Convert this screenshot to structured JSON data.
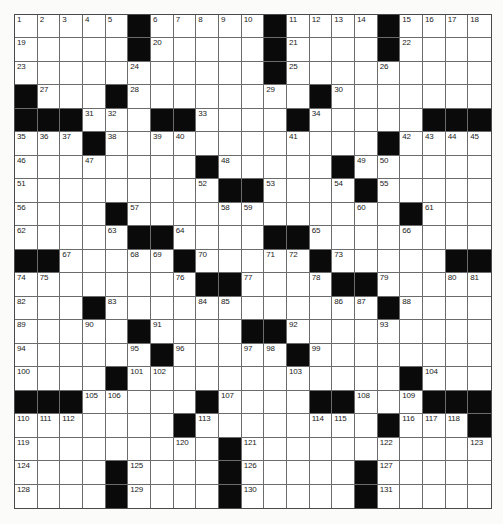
{
  "puzzle": {
    "rows": 21,
    "cols": 21,
    "colors": {
      "black_square": "#0a0a0a",
      "white_square": "#ffffff",
      "grid_line": "#6b6b6b",
      "background": "#fbfbfa"
    },
    "legend": "'#' = black square, number = clue label cell, '.' = empty white cell",
    "grid": [
      [
        "1",
        "2",
        "3",
        "4",
        "5",
        "#",
        "6",
        "7",
        "8",
        "9",
        "10",
        "#",
        "11",
        "12",
        "13",
        "14",
        "#",
        "15",
        "16",
        "17",
        "18"
      ],
      [
        "19",
        ".",
        ".",
        ".",
        ".",
        "#",
        "20",
        ".",
        ".",
        ".",
        ".",
        "#",
        "21",
        ".",
        ".",
        ".",
        "#",
        "22",
        ".",
        ".",
        "."
      ],
      [
        "23",
        ".",
        ".",
        ".",
        ".",
        "24",
        ".",
        ".",
        ".",
        ".",
        ".",
        "#",
        "25",
        ".",
        ".",
        ".",
        "26",
        ".",
        ".",
        ".",
        "."
      ],
      [
        "#",
        "27",
        ".",
        ".",
        "#",
        "28",
        ".",
        ".",
        ".",
        ".",
        ".",
        "29",
        ".",
        "#",
        "30",
        ".",
        ".",
        ".",
        ".",
        ".",
        "."
      ],
      [
        "#",
        "#",
        "#",
        "31",
        "32",
        ".",
        "#",
        "#",
        "33",
        ".",
        ".",
        ".",
        "#",
        "34",
        ".",
        ".",
        ".",
        ".",
        "#",
        "#",
        "#"
      ],
      [
        "35",
        "36",
        "37",
        "#",
        "38",
        ".",
        "39",
        "40",
        ".",
        ".",
        ".",
        ".",
        "41",
        ".",
        ".",
        ".",
        "#",
        "42",
        "43",
        "44",
        "45"
      ],
      [
        "46",
        ".",
        ".",
        "47",
        ".",
        ".",
        ".",
        ".",
        "#",
        "48",
        ".",
        ".",
        ".",
        ".",
        "#",
        "49",
        "50",
        ".",
        ".",
        ".",
        "."
      ],
      [
        "51",
        ".",
        ".",
        ".",
        ".",
        ".",
        ".",
        ".",
        "52",
        "#",
        "#",
        "53",
        ".",
        ".",
        "54",
        "#",
        "55",
        ".",
        ".",
        ".",
        "."
      ],
      [
        "56",
        ".",
        ".",
        ".",
        "#",
        "57",
        ".",
        ".",
        ".",
        "58",
        "59",
        ".",
        ".",
        ".",
        ".",
        "60",
        ".",
        "#",
        "61",
        ".",
        "."
      ],
      [
        "62",
        ".",
        ".",
        ".",
        "63",
        "#",
        "#",
        "64",
        ".",
        ".",
        ".",
        "#",
        "#",
        "65",
        ".",
        ".",
        ".",
        "66",
        ".",
        ".",
        "."
      ],
      [
        "#",
        "#",
        "67",
        ".",
        ".",
        "68",
        "69",
        "#",
        "70",
        ".",
        ".",
        "71",
        "72",
        "#",
        "73",
        ".",
        ".",
        ".",
        ".",
        "#",
        "#"
      ],
      [
        "74",
        "75",
        ".",
        ".",
        ".",
        ".",
        ".",
        "76",
        "#",
        "#",
        "77",
        ".",
        ".",
        "78",
        "#",
        "#",
        "79",
        ".",
        ".",
        "80",
        "81"
      ],
      [
        "82",
        ".",
        ".",
        "#",
        "83",
        ".",
        ".",
        ".",
        "84",
        "85",
        ".",
        ".",
        ".",
        ".",
        "86",
        "87",
        "#",
        "88",
        ".",
        ".",
        "."
      ],
      [
        "89",
        ".",
        ".",
        "90",
        ".",
        "#",
        "91",
        ".",
        ".",
        ".",
        "#",
        "#",
        "92",
        ".",
        ".",
        ".",
        "93",
        ".",
        ".",
        ".",
        "."
      ],
      [
        "94",
        ".",
        ".",
        ".",
        ".",
        "95",
        "#",
        "96",
        ".",
        ".",
        "97",
        "98",
        "#",
        "99",
        ".",
        ".",
        ".",
        ".",
        ".",
        ".",
        "."
      ],
      [
        "100",
        ".",
        ".",
        ".",
        "#",
        "101",
        "102",
        ".",
        ".",
        ".",
        ".",
        ".",
        "103",
        ".",
        ".",
        ".",
        ".",
        "#",
        "104",
        ".",
        "."
      ],
      [
        "#",
        "#",
        "#",
        "105",
        "106",
        ".",
        ".",
        ".",
        "#",
        "107",
        ".",
        ".",
        ".",
        "#",
        "#",
        "108",
        ".",
        "109",
        "#",
        "#",
        "#"
      ],
      [
        "110",
        "111",
        "112",
        ".",
        ".",
        ".",
        ".",
        "#",
        "113",
        ".",
        ".",
        ".",
        ".",
        "114",
        "115",
        ".",
        "#",
        "116",
        "117",
        "118",
        "#"
      ],
      [
        "119",
        ".",
        ".",
        ".",
        ".",
        ".",
        ".",
        "120",
        ".",
        "#",
        "121",
        ".",
        ".",
        ".",
        ".",
        ".",
        "122",
        ".",
        ".",
        ".",
        "123"
      ],
      [
        "124",
        ".",
        ".",
        ".",
        "#",
        "125",
        ".",
        ".",
        ".",
        "#",
        "126",
        ".",
        ".",
        ".",
        ".",
        "#",
        "127",
        ".",
        ".",
        ".",
        "."
      ],
      [
        "128",
        ".",
        ".",
        ".",
        "#",
        "129",
        ".",
        ".",
        ".",
        "#",
        "130",
        ".",
        ".",
        ".",
        ".",
        "#",
        "131",
        ".",
        ".",
        ".",
        "."
      ]
    ],
    "entries": {}
  }
}
